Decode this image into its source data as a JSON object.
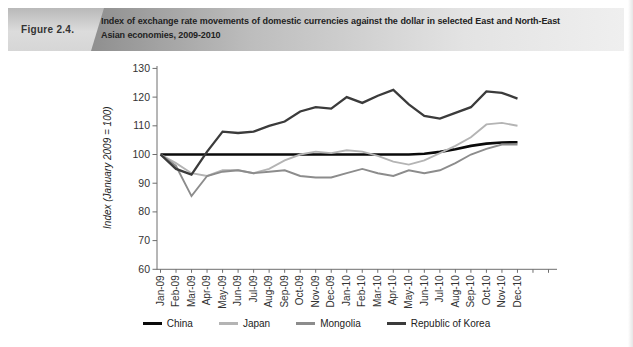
{
  "figure_header": {
    "label": "Figure 2.4.",
    "title": "Index of exchange rate movements of domestic currencies against the dollar in selected East and North-East Asian economies, 2009-2010"
  },
  "chart_data": {
    "type": "line",
    "title": "",
    "xlabel": "",
    "ylabel": "Index (January 2009 = 100)",
    "ylim": [
      60,
      130
    ],
    "yticks": [
      60,
      70,
      80,
      90,
      100,
      110,
      120,
      130
    ],
    "grid": false,
    "legend_position": "bottom",
    "categories": [
      "Jan-09",
      "Feb-09",
      "Mar-09",
      "Apr-09",
      "May-09",
      "Jun-09",
      "Jul-09",
      "Aug-09",
      "Sep-09",
      "Oct-09",
      "Nov-09",
      "Dec-09",
      "Jan-10",
      "Feb-10",
      "Mar-10",
      "Apr-10",
      "May-10",
      "Jun-10",
      "Jul-10",
      "Aug-10",
      "Sep-10",
      "Oct-10",
      "Nov-10",
      "Dec-10"
    ],
    "series": [
      {
        "name": "China",
        "color": "#0a0a0a",
        "stroke_width": 2.6,
        "values": [
          100,
          100,
          100,
          100,
          100,
          100,
          100,
          100,
          100,
          100,
          100,
          100,
          100,
          100,
          100,
          100,
          100,
          100.3,
          100.9,
          101.8,
          103,
          103.8,
          104.2,
          104.3
        ]
      },
      {
        "name": "Japan",
        "color": "#b4b4b4",
        "stroke_width": 1.9,
        "values": [
          100,
          97,
          93.5,
          92.5,
          94.5,
          94.5,
          93.5,
          95,
          98,
          100,
          101,
          100.5,
          101.5,
          101,
          99.5,
          97.5,
          96.5,
          98,
          100.5,
          103,
          106,
          110.5,
          111,
          110
        ]
      },
      {
        "name": "Mongolia",
        "color": "#8c8c8c",
        "stroke_width": 1.9,
        "values": [
          100,
          96,
          85.5,
          92.5,
          94,
          94.5,
          93.5,
          94,
          94.5,
          92.5,
          92,
          92,
          93.5,
          95,
          93.5,
          92.5,
          94.5,
          93.5,
          94.5,
          97,
          100,
          102,
          103.5,
          103.5
        ]
      },
      {
        "name": "Republic of Korea",
        "color": "#3b3b3b",
        "stroke_width": 2.3,
        "values": [
          100,
          95,
          93,
          101,
          108,
          107.5,
          108,
          110,
          111.5,
          115,
          116.5,
          116,
          120,
          118,
          120.5,
          122.5,
          117.5,
          113.5,
          112.5,
          114.5,
          116.5,
          122,
          121.5,
          119.5
        ]
      }
    ]
  }
}
